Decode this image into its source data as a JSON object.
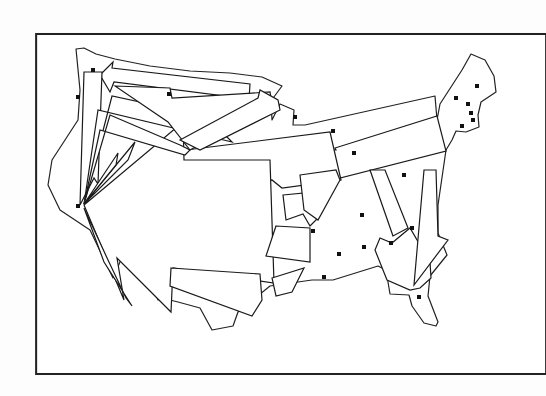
{
  "figure": {
    "type": "flow-map",
    "colors": {
      "stroke": "#1a1a1a",
      "fill": "#ffffff",
      "frame": "#222222"
    }
  },
  "frame": {
    "x": 17,
    "y": 16,
    "width": 240,
    "height": 160
  },
  "destination": {
    "name": "california-hub",
    "x": 80,
    "y": 205
  },
  "cities": [
    {
      "x": 93,
      "y": 70
    },
    {
      "x": 78,
      "y": 97
    },
    {
      "x": 169,
      "y": 94
    },
    {
      "x": 295,
      "y": 117
    },
    {
      "x": 333,
      "y": 131
    },
    {
      "x": 456,
      "y": 98
    },
    {
      "x": 468,
      "y": 104
    },
    {
      "x": 477,
      "y": 86
    },
    {
      "x": 471,
      "y": 113
    },
    {
      "x": 473,
      "y": 120
    },
    {
      "x": 462,
      "y": 126
    },
    {
      "x": 404,
      "y": 175
    },
    {
      "x": 362,
      "y": 215
    },
    {
      "x": 313,
      "y": 231
    },
    {
      "x": 339,
      "y": 254
    },
    {
      "x": 364,
      "y": 247
    },
    {
      "x": 391,
      "y": 243
    },
    {
      "x": 324,
      "y": 277
    },
    {
      "x": 412,
      "y": 228
    },
    {
      "x": 419,
      "y": 297
    },
    {
      "x": 78,
      "y": 206
    },
    {
      "x": 354,
      "y": 153
    }
  ]
}
